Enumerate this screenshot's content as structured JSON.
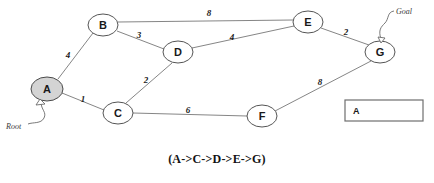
{
  "diagram": {
    "title_caption": "(A->C->D->E->G)",
    "nodes": [
      {
        "id": "A",
        "label": "A",
        "cx": 47,
        "cy": 89,
        "rx": 16,
        "ry": 12,
        "shaded": true
      },
      {
        "id": "B",
        "label": "B",
        "cx": 103,
        "cy": 25,
        "rx": 15,
        "ry": 11,
        "shaded": false
      },
      {
        "id": "C",
        "label": "C",
        "cx": 118,
        "cy": 113,
        "rx": 15,
        "ry": 11,
        "shaded": false
      },
      {
        "id": "D",
        "label": "D",
        "cx": 178,
        "cy": 52,
        "rx": 15,
        "ry": 11,
        "shaded": false
      },
      {
        "id": "E",
        "label": "E",
        "cx": 308,
        "cy": 22,
        "rx": 15,
        "ry": 11,
        "shaded": false
      },
      {
        "id": "F",
        "label": "F",
        "cx": 262,
        "cy": 116,
        "rx": 15,
        "ry": 11,
        "shaded": false
      },
      {
        "id": "G",
        "label": "G",
        "cx": 380,
        "cy": 52,
        "rx": 15,
        "ry": 11,
        "shaded": false
      }
    ],
    "edges": [
      {
        "from": "A",
        "to": "B",
        "weight": "4",
        "lx": 68,
        "ly": 55
      },
      {
        "from": "A",
        "to": "C",
        "weight": "1",
        "lx": 83,
        "ly": 99
      },
      {
        "from": "B",
        "to": "E",
        "weight": "8",
        "lx": 209,
        "ly": 13
      },
      {
        "from": "B",
        "to": "D",
        "weight": "3",
        "lx": 139,
        "ly": 35
      },
      {
        "from": "C",
        "to": "D",
        "weight": "2",
        "lx": 146,
        "ly": 80
      },
      {
        "from": "C",
        "to": "F",
        "weight": "6",
        "lx": 188,
        "ly": 110
      },
      {
        "from": "D",
        "to": "E",
        "weight": "4",
        "lx": 232,
        "ly": 37
      },
      {
        "from": "E",
        "to": "G",
        "weight": "2",
        "lx": 346,
        "ly": 32
      },
      {
        "from": "F",
        "to": "G",
        "weight": "8",
        "lx": 320,
        "ly": 82
      }
    ],
    "annotations": [
      {
        "name": "root-annotation",
        "text": "Root",
        "x": 6,
        "y": 124,
        "target": "A"
      },
      {
        "name": "goal-annotation",
        "text": "Goal",
        "x": 396,
        "y": 10,
        "target": "G"
      }
    ],
    "stack_panel": {
      "x": 345,
      "y": 100,
      "width": 78,
      "height": 21,
      "items": [
        {
          "label": "A"
        }
      ]
    }
  }
}
